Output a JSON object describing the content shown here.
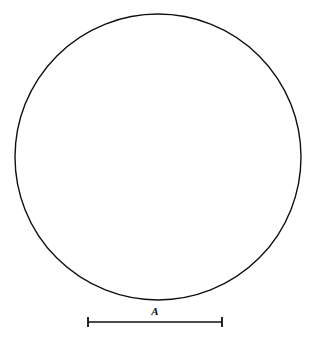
{
  "figure": {
    "kind": "distorted-checkerboard-disc",
    "background_color": "#ffffff",
    "ink_color": "#0d0d0d",
    "disc": {
      "center_x": 158,
      "center_y": 157,
      "radius": 143,
      "outline_color": "#101010",
      "outline_width": 1.4,
      "fill_color": "#ffffff"
    },
    "checkerboard": {
      "cells_across_diameter": 12,
      "cell_pitch_px": 24,
      "light_color": "#ffffff",
      "dark_color": "#0d0d0d",
      "parity_offset": 0,
      "distortion": {
        "type": "pincushion",
        "k1": 0.085,
        "k2": 0.012,
        "subdivisions": 6
      },
      "grid_half_extent_cells": 7
    }
  },
  "scale_bar": {
    "label": "A",
    "label_x": 155,
    "label_y": 315,
    "x_start": 88,
    "x_end": 222,
    "y": 322,
    "line_width": 1.6,
    "cap_height": 9,
    "cap_width": 1.8,
    "color": "#101010"
  },
  "chart_data": {
    "type": "scatter",
    "title": "",
    "xlabel": "",
    "ylabel": "",
    "categories": [
      "A"
    ],
    "values": [
      134
    ]
  }
}
